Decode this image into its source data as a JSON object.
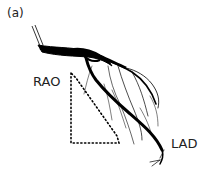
{
  "figure": {
    "panel_label": "(a)",
    "labels": {
      "rao": "RAO",
      "lad": "LAD"
    },
    "colors": {
      "vessel": "#000000",
      "background": "#ffffff",
      "text": "#222222"
    },
    "annotation_shape": "dotted-triangle"
  }
}
